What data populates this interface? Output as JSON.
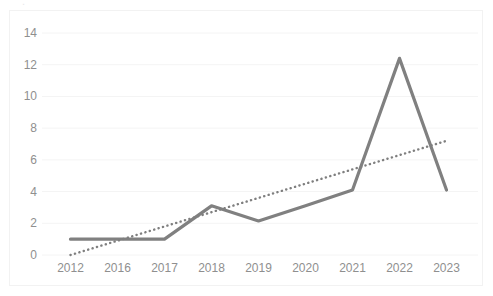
{
  "chart_data": {
    "type": "line",
    "title": "",
    "subtitle": "",
    "xlabel": "",
    "ylabel": "",
    "categories": [
      "2012",
      "2016",
      "2017",
      "2018",
      "2019",
      "2020",
      "2021",
      "2022",
      "2023"
    ],
    "series": [
      {
        "name": "Series 1",
        "type": "line",
        "color": "#808080",
        "style": "solid",
        "values": [
          1,
          1,
          1,
          3.1,
          2.15,
          3.1,
          4.1,
          12.4,
          4.1
        ]
      },
      {
        "name": "Linear trendline",
        "type": "line",
        "color": "#7f7f7f",
        "style": "dotted",
        "values": [
          0.0,
          0.9,
          1.8,
          2.7,
          3.6,
          4.5,
          5.4,
          6.3,
          7.2
        ]
      }
    ],
    "ylim": [
      0,
      14
    ],
    "yticks": [
      0,
      2,
      4,
      6,
      8,
      10,
      12,
      14
    ],
    "ytick_labels": [
      "0",
      "2",
      "4",
      "6",
      "8",
      "10",
      "12",
      "14"
    ],
    "grid": true,
    "grid_axis": "y",
    "grid_color": "#f4f4f4",
    "legend": false,
    "legend_position": "none",
    "background": "#ffffff",
    "axis_text_color": "#8f8f8f"
  },
  "artifact": {
    "top_fragment": "."
  }
}
